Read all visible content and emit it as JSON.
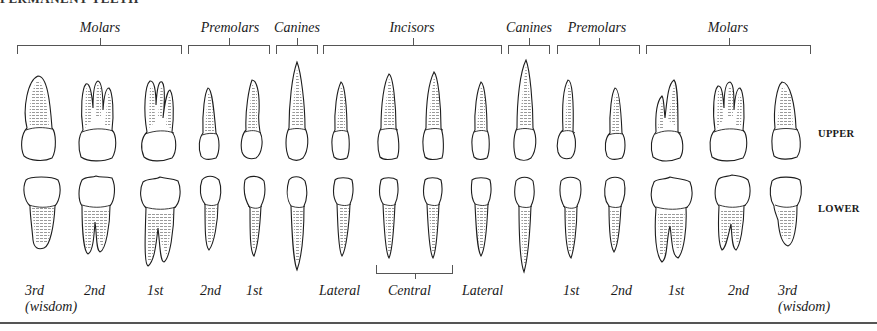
{
  "title": "PERMANENT TEETH",
  "groups": [
    {
      "label": "Molars",
      "left": 17,
      "width": 165,
      "center": 100
    },
    {
      "label": "Premolars",
      "left": 188,
      "width": 82,
      "center": 230
    },
    {
      "label": "Canines",
      "left": 276,
      "width": 42,
      "center": 297
    },
    {
      "label": "Incisors",
      "left": 323,
      "width": 179,
      "center": 412
    },
    {
      "label": "Canines",
      "left": 508,
      "width": 42,
      "center": 529
    },
    {
      "label": "Premolars",
      "left": 557,
      "width": 83,
      "center": 597
    },
    {
      "label": "Molars",
      "left": 646,
      "width": 165,
      "center": 728
    }
  ],
  "rows": {
    "upper": "UPPER",
    "lower": "LOWER"
  },
  "positions": [
    {
      "label": "3rd",
      "sub": "(wisdom)",
      "x": 25
    },
    {
      "label": "2nd",
      "sub": "",
      "x": 84
    },
    {
      "label": "1st",
      "sub": "",
      "x": 147
    },
    {
      "label": "2nd",
      "sub": "",
      "x": 200
    },
    {
      "label": "1st",
      "sub": "",
      "x": 246
    },
    {
      "label": "Lateral",
      "sub": "",
      "x": 319
    },
    {
      "label": "Central",
      "sub": "",
      "x": 388
    },
    {
      "label": "Lateral",
      "sub": "",
      "x": 462
    },
    {
      "label": "1st",
      "sub": "",
      "x": 563
    },
    {
      "label": "2nd",
      "sub": "",
      "x": 611
    },
    {
      "label": "1st",
      "sub": "",
      "x": 668
    },
    {
      "label": "2nd",
      "sub": "",
      "x": 728
    },
    {
      "label": "3rd",
      "sub": "(wisdom)",
      "x": 778
    }
  ],
  "central_bracket_label": "Central"
}
